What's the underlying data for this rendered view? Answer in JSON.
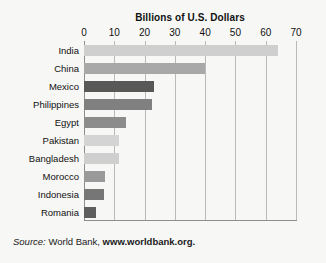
{
  "chart_data": {
    "type": "bar",
    "orientation": "horizontal",
    "title": "Billions of U.S. Dollars",
    "xlabel": "",
    "ylabel": "",
    "xlim": [
      0,
      70
    ],
    "xticks": [
      0,
      10,
      20,
      30,
      40,
      50,
      60,
      70
    ],
    "grid": "vertical",
    "legend": "none",
    "categories": [
      "India",
      "China",
      "Mexico",
      "Philippines",
      "Egypt",
      "Pakistan",
      "Bangladesh",
      "Morocco",
      "Indonesia",
      "Romania"
    ],
    "values": [
      64,
      40,
      23,
      22.5,
      14,
      11.5,
      11.5,
      7,
      6.5,
      4
    ],
    "bar_colors": [
      "#cfcfcf",
      "#a8a8a8",
      "#585858",
      "#808080",
      "#8c8c8c",
      "#d4d4d4",
      "#cfcfcf",
      "#9a9a9a",
      "#767676",
      "#5e5e5e"
    ]
  },
  "source": {
    "prefix": "Source:",
    "publisher": "World Bank,",
    "url": "www.worldbank.org."
  },
  "colors": {
    "background": "#f7f7f5",
    "gridline": "#b9b9b9",
    "axis": "#8e8e8e",
    "text": "#111111"
  }
}
